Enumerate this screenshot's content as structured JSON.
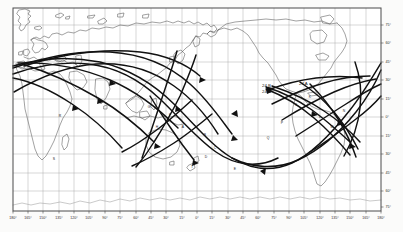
{
  "figure": {
    "kind": "world-map-ground-track-chart",
    "projection": "cylindrical",
    "background_color": "#fbfbfa",
    "frame_color": "#4a4a4a",
    "graticule_color": "#8d8d8d",
    "coastline_color": "#555555",
    "track_color": "#111111",
    "plot_box": {
      "left": 13,
      "top": 8,
      "right": 381,
      "bottom": 211
    }
  },
  "chart_data": {
    "type": "line",
    "title": "",
    "subtitle": "",
    "xlabel": "",
    "ylabel": "",
    "grid": true,
    "legend_position": "none",
    "xlim": [
      -180,
      180
    ],
    "ylim": [
      -90,
      90
    ],
    "x_tick_values": [
      -180,
      -165,
      -150,
      -135,
      -120,
      -105,
      -90,
      -75,
      -60,
      -45,
      -30,
      -15,
      0,
      15,
      30,
      45,
      60,
      75,
      90,
      105,
      120,
      135,
      150,
      165,
      180
    ],
    "x_tick_labels": [
      "180°",
      "165°",
      "150°",
      "135°",
      "120°",
      "105°",
      "90°",
      "75°",
      "60°",
      "45°",
      "30°",
      "15°",
      "0°",
      "15°",
      "30°",
      "45°",
      "60°",
      "75°",
      "90°",
      "105°",
      "120°",
      "135°",
      "150°",
      "165°",
      "180°"
    ],
    "y_tick_values": [
      75,
      60,
      45,
      30,
      15,
      0,
      -15,
      -30,
      -45,
      -60,
      -75
    ],
    "y_tick_labels": [
      "75°",
      "60°",
      "45°",
      "30°",
      "15°",
      "0°",
      "15°",
      "30°",
      "45°",
      "60°",
      "75°"
    ],
    "y_axis_side": "right",
    "series": [
      {
        "name": "24 A",
        "note": "ground track, arrowed, descending over North America"
      },
      {
        "name": "24 B",
        "note": "ground track, arrowed, NE Pacific entry"
      },
      {
        "name": "24 C",
        "note": "ground track, arrowed, NE Pacific entry, below 24 B"
      }
    ],
    "annotations": [
      {
        "label": "24 B",
        "x": -150,
        "y": 50
      },
      {
        "label": "24 C",
        "x": -150,
        "y": 45
      },
      {
        "label": "24 A",
        "x": -105,
        "y": 51
      }
    ]
  },
  "labels": {
    "track_24a": "24 A",
    "track_24b": "24 B",
    "track_24c": "24 C"
  },
  "x_axis": {
    "ticks": [
      {
        "label": "180°",
        "px": 13
      },
      {
        "label": "165°",
        "px": 28
      },
      {
        "label": "150°",
        "px": 43
      },
      {
        "label": "135°",
        "px": 59
      },
      {
        "label": "120°",
        "px": 74
      },
      {
        "label": "105°",
        "px": 89
      },
      {
        "label": "90°",
        "px": 105
      },
      {
        "label": "75°",
        "px": 120
      },
      {
        "label": "60°",
        "px": 136
      },
      {
        "label": "45°",
        "px": 151
      },
      {
        "label": "30°",
        "px": 166
      },
      {
        "label": "15°",
        "px": 182
      },
      {
        "label": "0°",
        "px": 197
      },
      {
        "label": "15°",
        "px": 212
      },
      {
        "label": "30°",
        "px": 228
      },
      {
        "label": "45°",
        "px": 243
      },
      {
        "label": "60°",
        "px": 258
      },
      {
        "label": "75°",
        "px": 274
      },
      {
        "label": "90°",
        "px": 289
      },
      {
        "label": "105°",
        "px": 304
      },
      {
        "label": "120°",
        "px": 320
      },
      {
        "label": "135°",
        "px": 335
      },
      {
        "label": "150°",
        "px": 350
      },
      {
        "label": "165°",
        "px": 366
      },
      {
        "label": "180°",
        "px": 381
      }
    ]
  },
  "y_axis": {
    "ticks": [
      {
        "label": "75°",
        "px": 25
      },
      {
        "label": "60°",
        "px": 43
      },
      {
        "label": "45°",
        "px": 62
      },
      {
        "label": "30°",
        "px": 80
      },
      {
        "label": "15°",
        "px": 99
      },
      {
        "label": "0°",
        "px": 117
      },
      {
        "label": "15°",
        "px": 136
      },
      {
        "label": "30°",
        "px": 154
      },
      {
        "label": "45°",
        "px": 173
      },
      {
        "label": "60°",
        "px": 191
      },
      {
        "label": "75°",
        "px": 207
      }
    ]
  },
  "track_point_labels": [
    {
      "text": "A",
      "x": 183,
      "y": 128
    },
    {
      "text": "B",
      "x": 205,
      "y": 136
    },
    {
      "text": "C",
      "x": 215,
      "y": 149
    },
    {
      "text": "D",
      "x": 206,
      "y": 158
    },
    {
      "text": "E",
      "x": 235,
      "y": 170
    },
    {
      "text": "F",
      "x": 170,
      "y": 116
    },
    {
      "text": "G",
      "x": 149,
      "y": 108
    },
    {
      "text": "H",
      "x": 157,
      "y": 128
    },
    {
      "text": "J",
      "x": 296,
      "y": 106
    },
    {
      "text": "K",
      "x": 310,
      "y": 98
    },
    {
      "text": "L",
      "x": 320,
      "y": 118
    },
    {
      "text": "M",
      "x": 332,
      "y": 128
    },
    {
      "text": "N",
      "x": 344,
      "y": 112
    },
    {
      "text": "P",
      "x": 282,
      "y": 124
    },
    {
      "text": "Q",
      "x": 268,
      "y": 139
    },
    {
      "text": "R",
      "x": 60,
      "y": 117
    },
    {
      "text": "S",
      "x": 54,
      "y": 160
    },
    {
      "text": "T",
      "x": 192,
      "y": 168
    }
  ]
}
